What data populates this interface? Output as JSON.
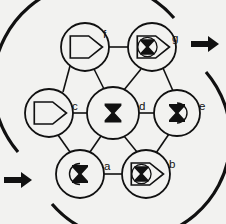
{
  "figure": {
    "title": "",
    "background_color": "#f2f2f0",
    "ink_color": "#111111",
    "width": 226,
    "height": 224
  },
  "nodes": [
    {
      "id": "f",
      "label": "f",
      "glyph": "pentagon-outline",
      "glyph_description": "right-pointing pentagon outline",
      "cx": 85,
      "cy": 47,
      "r": 24,
      "label_x": 103,
      "label_y": 38
    },
    {
      "id": "g",
      "label": "g",
      "glyph": "pentagon-with-hourglass",
      "glyph_description": "right-pointing pentagon containing crossed hourglass",
      "cx": 152,
      "cy": 47,
      "r": 24,
      "label_x": 172,
      "label_y": 42
    },
    {
      "id": "c",
      "label": "c",
      "glyph": "pentagon-outline",
      "glyph_description": "right-pointing pentagon outline",
      "cx": 49,
      "cy": 113,
      "r": 24,
      "label_x": 72,
      "label_y": 110
    },
    {
      "id": "d",
      "label": "d",
      "glyph": "hourglass",
      "glyph_description": "filled hourglass / bowtie",
      "cx": 113,
      "cy": 113,
      "r": 26,
      "label_x": 139,
      "label_y": 110
    },
    {
      "id": "e",
      "label": "e",
      "glyph": "hourglass-with-arc-right",
      "glyph_description": "hourglass overlaid with right-facing arc",
      "cx": 177,
      "cy": 113,
      "r": 23,
      "label_x": 199,
      "label_y": 110
    },
    {
      "id": "a",
      "label": "a",
      "glyph": "hourglass-with-arc-left",
      "glyph_description": "hourglass overlaid with left-facing arc",
      "cx": 80,
      "cy": 174,
      "r": 24,
      "label_x": 104,
      "label_y": 170
    },
    {
      "id": "b",
      "label": "b",
      "glyph": "pentagon-with-hourglass",
      "glyph_description": "right-pointing pentagon containing crossed hourglass",
      "cx": 146,
      "cy": 174,
      "r": 24,
      "label_x": 169,
      "label_y": 168
    }
  ],
  "edges": [
    {
      "from": "f",
      "to": "g"
    },
    {
      "from": "f",
      "to": "c"
    },
    {
      "from": "f",
      "to": "d"
    },
    {
      "from": "g",
      "to": "d"
    },
    {
      "from": "g",
      "to": "e"
    },
    {
      "from": "c",
      "to": "d"
    },
    {
      "from": "c",
      "to": "a"
    },
    {
      "from": "d",
      "to": "e"
    },
    {
      "from": "d",
      "to": "a"
    },
    {
      "from": "d",
      "to": "b"
    },
    {
      "from": "e",
      "to": "b"
    },
    {
      "from": "a",
      "to": "b"
    }
  ],
  "arcs": [
    {
      "name": "outer-left-arc",
      "description": "heavy arc sweeping from lower-left up over the top to the right",
      "path": "M 18 152 A 98 98 0 0 1 174 18"
    },
    {
      "name": "outer-right-arc",
      "description": "heavy arc sweeping from upper-right down around to the lower-left",
      "path": "M 206 72 A 98 98 0 0 1 52 204"
    }
  ],
  "arrows": [
    {
      "name": "arrow-top-right",
      "direction": "right",
      "x": 191,
      "y": 44
    },
    {
      "name": "arrow-bottom-left",
      "direction": "right",
      "x": 4,
      "y": 180
    }
  ]
}
